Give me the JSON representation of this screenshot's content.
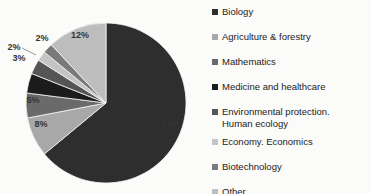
{
  "chart_data": {
    "type": "pie",
    "title": "",
    "categories": [
      "Biology",
      "Agriculture & forestry",
      "Mathematics",
      "Medicine and healthcare",
      "Environmental protection. Human ecology",
      "Economy. Economics",
      "Biotechnology",
      "Other"
    ],
    "values": [
      64,
      8,
      5,
      4,
      3,
      2,
      2,
      12
    ],
    "labels": [
      "64%",
      "8%",
      "5%",
      "",
      "3%",
      "2%",
      "2%",
      "12%"
    ],
    "colors": [
      "#2e2e2e",
      "#a8a8a8",
      "#6a6a6a",
      "#1c1c1c",
      "#555555",
      "#c4c4c4",
      "#7a7a7a",
      "#bdbdbd"
    ],
    "legend_position": "right",
    "start_angle": "12 o'clock",
    "direction": "clockwise"
  },
  "legend": {
    "items": [
      {
        "label": "Biology"
      },
      {
        "label": "Agriculture & forestry"
      },
      {
        "label": "Mathematics"
      },
      {
        "label": "Medicine and healthcare"
      },
      {
        "label": "Environmental protection.",
        "label2": "Human ecology"
      },
      {
        "label": "Economy. Economics"
      },
      {
        "label": "Biotechnology"
      },
      {
        "label": "Other"
      }
    ]
  }
}
